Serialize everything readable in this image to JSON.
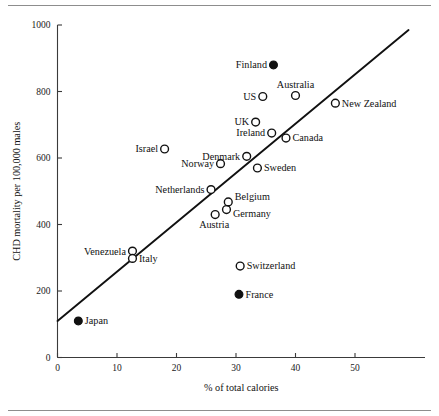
{
  "chart_data": {
    "type": "scatter",
    "title": "",
    "xlabel": "% of total calories",
    "ylabel": "CHD mortality per 100,000 males",
    "xlim": [
      0,
      59
    ],
    "ylim": [
      0,
      1000
    ],
    "xticks": [
      0,
      10,
      20,
      30,
      40,
      50
    ],
    "yticks": [
      0,
      200,
      400,
      600,
      800,
      1000
    ],
    "xtick_labels": [
      "0",
      "10",
      "20",
      "30",
      "40",
      "50"
    ],
    "ytick_labels": [
      "0",
      "200",
      "400",
      "600",
      "800",
      "1000"
    ],
    "grid": false,
    "legend": "none",
    "points": [
      {
        "label": "Japan",
        "x": 3.5,
        "y": 110,
        "marker": "filled",
        "label_side": "right"
      },
      {
        "label": "Venezuela",
        "x": 12.6,
        "y": 320,
        "marker": "open",
        "label_side": "left"
      },
      {
        "label": "Italy",
        "x": 12.6,
        "y": 298,
        "marker": "open",
        "label_side": "right"
      },
      {
        "label": "Austria",
        "x": 26.5,
        "y": 430,
        "marker": "open",
        "label_side": "below"
      },
      {
        "label": "Netherlands",
        "x": 25.8,
        "y": 505,
        "marker": "open",
        "label_side": "left"
      },
      {
        "label": "Germany",
        "x": 28.4,
        "y": 445,
        "marker": "open",
        "label_side": "right-low"
      },
      {
        "label": "Belgium",
        "x": 28.7,
        "y": 468,
        "marker": "open",
        "label_side": "right-high"
      },
      {
        "label": "Norway",
        "x": 27.4,
        "y": 583,
        "marker": "open",
        "label_side": "left"
      },
      {
        "label": "Denmark",
        "x": 31.8,
        "y": 605,
        "marker": "open",
        "label_side": "left"
      },
      {
        "label": "Sweden",
        "x": 33.6,
        "y": 570,
        "marker": "open",
        "label_side": "right"
      },
      {
        "label": "Israel",
        "x": 18.0,
        "y": 627,
        "marker": "open",
        "label_side": "left"
      },
      {
        "label": "UK",
        "x": 33.3,
        "y": 708,
        "marker": "open",
        "label_side": "left"
      },
      {
        "label": "Ireland",
        "x": 36.0,
        "y": 675,
        "marker": "open",
        "label_side": "left"
      },
      {
        "label": "Canada",
        "x": 38.4,
        "y": 660,
        "marker": "open",
        "label_side": "right"
      },
      {
        "label": "US",
        "x": 34.5,
        "y": 785,
        "marker": "open",
        "label_side": "left"
      },
      {
        "label": "Australia",
        "x": 40.0,
        "y": 788,
        "marker": "open",
        "label_side": "above"
      },
      {
        "label": "New Zealand",
        "x": 46.7,
        "y": 765,
        "marker": "open",
        "label_side": "right"
      },
      {
        "label": "Finland",
        "x": 36.3,
        "y": 880,
        "marker": "filled",
        "label_side": "left"
      },
      {
        "label": "Switzerland",
        "x": 30.7,
        "y": 275,
        "marker": "open",
        "label_side": "right"
      },
      {
        "label": "France",
        "x": 30.5,
        "y": 190,
        "marker": "filled",
        "label_side": "right"
      }
    ],
    "fit_line": {
      "type": "linear-regression",
      "x_start": 0,
      "y_start": 110,
      "x_end": 59,
      "y_end": 985
    }
  }
}
